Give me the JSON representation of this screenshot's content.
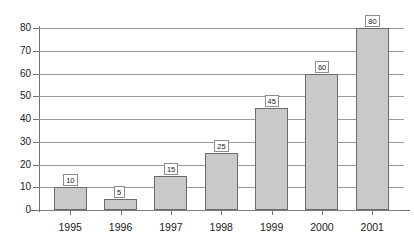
{
  "chart_data": {
    "type": "bar",
    "title": "",
    "subtitle": "",
    "xlabel": "",
    "ylabel": "",
    "categories": [
      "1995",
      "1996",
      "1997",
      "1998",
      "1999",
      "2000",
      "2001"
    ],
    "values": [
      10,
      5,
      15,
      25,
      45,
      60,
      80
    ],
    "value_labels": [
      "10",
      "5",
      "15",
      "25",
      "45",
      "60",
      "80"
    ],
    "ylim": [
      0,
      80
    ],
    "y_ticks": [
      0,
      10,
      20,
      30,
      40,
      50,
      60,
      70,
      80
    ],
    "y_tick_labels": [
      "0",
      "10",
      "20",
      "30",
      "40",
      "50",
      "60",
      "70",
      "80"
    ],
    "grid": true,
    "grid_orientation": "horizontal",
    "legend": false,
    "legend_position": "none",
    "annotations": "each bar is topped with a boxed value label",
    "colors": {
      "bar_fill": "#c9c9c9",
      "bar_border": "#6b6b6b",
      "gridline": "#9a9a9a",
      "axis": "#6f6f6f",
      "label_box_fill": "#ffffff",
      "label_box_border": "#8d8d8d",
      "text": "#1a1a1a",
      "background": "#ffffff"
    }
  }
}
